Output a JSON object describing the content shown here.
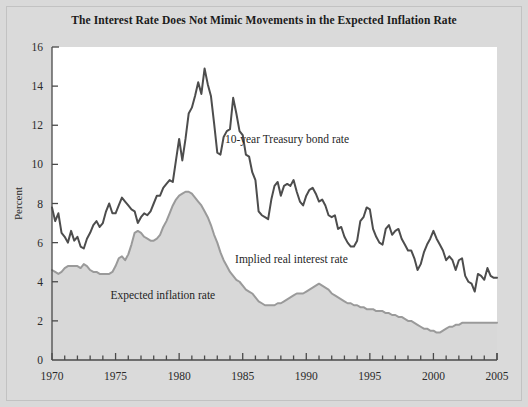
{
  "figure": {
    "background_color": "#d9d9d9",
    "plot_background_color": "#ffffff",
    "border_color": "#c2c2c2"
  },
  "chart_data": {
    "type": "line",
    "title": "The Interest Rate Does Not Mimic Movements in the Expected Inflation Rate",
    "xlabel": "",
    "ylabel": "Percent",
    "xlim": [
      1970,
      2005
    ],
    "ylim": [
      0,
      16
    ],
    "ytick_step": 2,
    "yticks": [
      0,
      2,
      4,
      6,
      8,
      10,
      12,
      14,
      16
    ],
    "xticks": [
      1970,
      1975,
      1980,
      1985,
      1990,
      1995,
      2000,
      2005
    ],
    "xminor_tick_step": 1,
    "grid": false,
    "legend": "inline-annotations",
    "annotations": [
      {
        "text": "10-year Treasury bond rate",
        "x": 1983.6,
        "y": 11.1,
        "series": "10-year Treasury bond rate"
      },
      {
        "text": "Implied real interest rate",
        "x": 1984.4,
        "y": 4.95,
        "series": "Implied real interest rate"
      },
      {
        "text": "Expected inflation rate",
        "x": 1974.6,
        "y": 3.1,
        "series": "Expected inflation rate"
      }
    ],
    "series": [
      {
        "name": "10-year Treasury bond rate",
        "color": "#4d4d4d",
        "line_width": 2.0,
        "fill": false,
        "x": [
          1970.0,
          1970.25,
          1970.5,
          1970.75,
          1971.0,
          1971.25,
          1971.5,
          1971.75,
          1972.0,
          1972.25,
          1972.5,
          1972.75,
          1973.0,
          1973.25,
          1973.5,
          1973.75,
          1974.0,
          1974.25,
          1974.5,
          1974.75,
          1975.0,
          1975.25,
          1975.5,
          1975.75,
          1976.0,
          1976.25,
          1976.5,
          1976.75,
          1977.0,
          1977.25,
          1977.5,
          1977.75,
          1978.0,
          1978.25,
          1978.5,
          1978.75,
          1979.0,
          1979.25,
          1979.5,
          1979.75,
          1980.0,
          1980.25,
          1980.5,
          1980.75,
          1981.0,
          1981.25,
          1981.5,
          1981.75,
          1982.0,
          1982.25,
          1982.5,
          1982.75,
          1983.0,
          1983.25,
          1983.5,
          1983.75,
          1984.0,
          1984.25,
          1984.5,
          1984.75,
          1985.0,
          1985.25,
          1985.5,
          1985.75,
          1986.0,
          1986.25,
          1986.5,
          1986.75,
          1987.0,
          1987.25,
          1987.5,
          1987.75,
          1988.0,
          1988.25,
          1988.5,
          1988.75,
          1989.0,
          1989.25,
          1989.5,
          1989.75,
          1990.0,
          1990.25,
          1990.5,
          1990.75,
          1991.0,
          1991.25,
          1991.5,
          1991.75,
          1992.0,
          1992.25,
          1992.5,
          1992.75,
          1993.0,
          1993.25,
          1993.5,
          1993.75,
          1994.0,
          1994.25,
          1994.5,
          1994.75,
          1995.0,
          1995.25,
          1995.5,
          1995.75,
          1996.0,
          1996.25,
          1996.5,
          1996.75,
          1997.0,
          1997.25,
          1997.5,
          1997.75,
          1998.0,
          1998.25,
          1998.5,
          1998.75,
          1999.0,
          1999.25,
          1999.5,
          1999.75,
          2000.0,
          2000.25,
          2000.5,
          2000.75,
          2001.0,
          2001.25,
          2001.5,
          2001.75,
          2002.0,
          2002.25,
          2002.5,
          2002.75,
          2003.0,
          2003.25,
          2003.5,
          2003.75,
          2004.0,
          2004.25,
          2004.5,
          2004.75,
          2005.0
        ],
        "y": [
          7.8,
          7.1,
          7.5,
          6.5,
          6.3,
          6.0,
          6.6,
          6.1,
          6.3,
          5.8,
          5.7,
          6.2,
          6.5,
          6.9,
          7.1,
          6.8,
          7.0,
          7.6,
          8.0,
          7.5,
          7.5,
          7.9,
          8.3,
          8.1,
          7.9,
          7.7,
          7.6,
          7.0,
          7.3,
          7.5,
          7.4,
          7.6,
          8.0,
          8.4,
          8.4,
          8.8,
          9.0,
          9.2,
          9.1,
          10.2,
          11.3,
          10.2,
          11.3,
          12.6,
          12.9,
          13.5,
          14.2,
          13.6,
          14.9,
          14.1,
          13.5,
          12.1,
          10.6,
          10.5,
          11.4,
          11.7,
          11.8,
          13.4,
          12.6,
          11.7,
          11.5,
          10.5,
          10.4,
          9.6,
          9.2,
          7.6,
          7.4,
          7.3,
          7.2,
          8.2,
          8.9,
          9.1,
          8.4,
          8.9,
          9.0,
          8.9,
          9.2,
          8.6,
          8.1,
          7.9,
          8.4,
          8.7,
          8.8,
          8.5,
          8.1,
          8.2,
          7.9,
          7.4,
          7.3,
          7.4,
          6.7,
          6.8,
          6.3,
          6.0,
          5.8,
          5.8,
          6.1,
          7.1,
          7.3,
          7.8,
          7.7,
          6.7,
          6.3,
          6.0,
          5.9,
          6.7,
          6.9,
          6.4,
          6.6,
          6.7,
          6.2,
          5.9,
          5.6,
          5.6,
          5.2,
          4.6,
          4.9,
          5.5,
          5.9,
          6.2,
          6.6,
          6.2,
          5.9,
          5.6,
          5.1,
          5.3,
          5.1,
          4.6,
          5.1,
          5.2,
          4.3,
          4.0,
          3.9,
          3.5,
          4.4,
          4.3,
          4.1,
          4.7,
          4.3,
          4.2,
          4.2
        ]
      },
      {
        "name": "Expected inflation rate",
        "color": "#9a9a9a",
        "line_width": 2.0,
        "fill": true,
        "fill_color": "#d8d8d8",
        "x": [
          1970.0,
          1970.25,
          1970.5,
          1970.75,
          1971.0,
          1971.25,
          1971.5,
          1971.75,
          1972.0,
          1972.25,
          1972.5,
          1972.75,
          1973.0,
          1973.25,
          1973.5,
          1973.75,
          1974.0,
          1974.25,
          1974.5,
          1974.75,
          1975.0,
          1975.25,
          1975.5,
          1975.75,
          1976.0,
          1976.25,
          1976.5,
          1976.75,
          1977.0,
          1977.25,
          1977.5,
          1977.75,
          1978.0,
          1978.25,
          1978.5,
          1978.75,
          1979.0,
          1979.25,
          1979.5,
          1979.75,
          1980.0,
          1980.25,
          1980.5,
          1980.75,
          1981.0,
          1981.25,
          1981.5,
          1981.75,
          1982.0,
          1982.25,
          1982.5,
          1982.75,
          1983.0,
          1983.25,
          1983.5,
          1983.75,
          1984.0,
          1984.25,
          1984.5,
          1984.75,
          1985.0,
          1985.25,
          1985.5,
          1985.75,
          1986.0,
          1986.25,
          1986.5,
          1986.75,
          1987.0,
          1987.25,
          1987.5,
          1987.75,
          1988.0,
          1988.25,
          1988.5,
          1988.75,
          1989.0,
          1989.25,
          1989.5,
          1989.75,
          1990.0,
          1990.25,
          1990.5,
          1990.75,
          1991.0,
          1991.25,
          1991.5,
          1991.75,
          1992.0,
          1992.25,
          1992.5,
          1992.75,
          1993.0,
          1993.25,
          1993.5,
          1993.75,
          1994.0,
          1994.25,
          1994.5,
          1994.75,
          1995.0,
          1995.25,
          1995.5,
          1995.75,
          1996.0,
          1996.25,
          1996.5,
          1996.75,
          1997.0,
          1997.25,
          1997.5,
          1997.75,
          1998.0,
          1998.25,
          1998.5,
          1998.75,
          1999.0,
          1999.25,
          1999.5,
          1999.75,
          2000.0,
          2000.25,
          2000.5,
          2000.75,
          2001.0,
          2001.25,
          2001.5,
          2001.75,
          2002.0,
          2002.25,
          2002.5,
          2002.75,
          2003.0,
          2003.25,
          2003.5,
          2003.75,
          2004.0,
          2004.25,
          2004.5,
          2004.75,
          2005.0
        ],
        "y": [
          4.6,
          4.5,
          4.4,
          4.5,
          4.7,
          4.8,
          4.8,
          4.8,
          4.8,
          4.7,
          4.9,
          4.8,
          4.6,
          4.5,
          4.5,
          4.4,
          4.4,
          4.4,
          4.4,
          4.5,
          4.8,
          5.2,
          5.3,
          5.1,
          5.4,
          5.9,
          6.5,
          6.6,
          6.5,
          6.3,
          6.2,
          6.1,
          6.1,
          6.2,
          6.4,
          6.8,
          7.1,
          7.5,
          7.9,
          8.2,
          8.4,
          8.5,
          8.6,
          8.6,
          8.5,
          8.3,
          8.1,
          7.9,
          7.6,
          7.3,
          6.9,
          6.4,
          6.0,
          5.5,
          5.1,
          4.8,
          4.5,
          4.3,
          4.1,
          4.0,
          3.8,
          3.6,
          3.5,
          3.4,
          3.2,
          3.0,
          2.9,
          2.8,
          2.8,
          2.8,
          2.8,
          2.9,
          2.9,
          3.0,
          3.1,
          3.2,
          3.3,
          3.4,
          3.4,
          3.4,
          3.5,
          3.6,
          3.7,
          3.8,
          3.9,
          3.8,
          3.7,
          3.6,
          3.4,
          3.3,
          3.2,
          3.1,
          3.0,
          2.9,
          2.9,
          2.8,
          2.8,
          2.7,
          2.7,
          2.6,
          2.6,
          2.6,
          2.5,
          2.5,
          2.5,
          2.4,
          2.4,
          2.3,
          2.3,
          2.2,
          2.2,
          2.1,
          2.0,
          2.0,
          1.9,
          1.8,
          1.7,
          1.6,
          1.6,
          1.5,
          1.5,
          1.4,
          1.4,
          1.5,
          1.6,
          1.7,
          1.7,
          1.8,
          1.8,
          1.9,
          1.9,
          1.9,
          1.9,
          1.9,
          1.9,
          1.9,
          1.9,
          1.9,
          1.9,
          1.9,
          1.9
        ]
      }
    ],
    "derived_series_note": "Implied real interest rate = vertical gap between the 10-year Treasury bond rate line and the expected inflation rate line"
  }
}
